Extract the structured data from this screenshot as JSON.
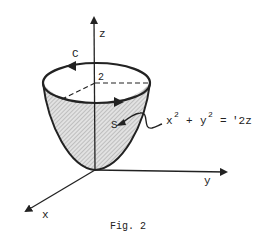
{
  "figure": {
    "caption": "Fig. 2",
    "axes": {
      "x_label": "x",
      "y_label": "y",
      "z_label": "z"
    },
    "curve_label": "C",
    "surface_label": "S",
    "height_label": "2",
    "equation": {
      "lhs_x": "x",
      "lhs_x_exp": "2",
      "plus": "+",
      "lhs_y": "y",
      "lhs_y_exp": "2",
      "equals": "=",
      "rhs": "'2z"
    },
    "colors": {
      "ink": "#222222",
      "shading": "#c8c8c8",
      "background": "#ffffff"
    }
  }
}
